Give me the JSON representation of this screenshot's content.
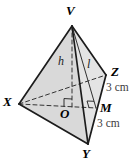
{
  "figure": {
    "canvas": {
      "width": 139,
      "height": 162,
      "background": "#ffffff"
    },
    "colors": {
      "edge": "#1c1c1c",
      "dashed": "#333333",
      "face_left": "#d9d9d9",
      "face_right": "#e4e4e4",
      "measure_text": "#3d3d3d"
    },
    "points": {
      "V": {
        "x": 72,
        "y": 26
      },
      "X": {
        "x": 19,
        "y": 104
      },
      "Y": {
        "x": 88,
        "y": 144
      },
      "Z": {
        "x": 106,
        "y": 75
      },
      "O": {
        "x": 72,
        "y": 107
      },
      "M": {
        "x": 96,
        "y": 108
      }
    },
    "faces": [
      {
        "name": "face-VXY",
        "pts": [
          "V",
          "X",
          "Y"
        ],
        "fill": "#d9d9d9"
      },
      {
        "name": "face-VYZ",
        "pts": [
          "V",
          "Y",
          "Z"
        ],
        "fill": "#e4e4e4"
      }
    ],
    "edges": [
      {
        "name": "hidden-edge-XZ",
        "from": "X",
        "to": "Z",
        "style": "dashed",
        "width": 1
      },
      {
        "name": "median-XM",
        "from": "X",
        "to": "M",
        "style": "dashed",
        "width": 1
      },
      {
        "name": "height-VO",
        "from": "V",
        "to": "O",
        "style": "dashed",
        "width": 1
      },
      {
        "name": "slant-VM",
        "from": "V",
        "to": "M",
        "style": "solid",
        "width": 0.9
      },
      {
        "name": "edge-VX",
        "from": "V",
        "to": "X",
        "style": "solid",
        "width": 1.7
      },
      {
        "name": "edge-VZ",
        "from": "V",
        "to": "Z",
        "style": "solid",
        "width": 1.7
      },
      {
        "name": "edge-VY",
        "from": "V",
        "to": "Y",
        "style": "solid",
        "width": 1.7
      },
      {
        "name": "edge-XY",
        "from": "X",
        "to": "Y",
        "style": "solid",
        "width": 1.7
      },
      {
        "name": "edge-YZ",
        "from": "Y",
        "to": "Z",
        "style": "solid",
        "width": 1.7
      }
    ],
    "right_angles": [
      {
        "name": "right-angle-at-O",
        "at": "O",
        "toward1": "V",
        "toward2": "X",
        "size": 8
      },
      {
        "name": "right-angle-at-M",
        "at": "M",
        "toward1": "V",
        "toward2": "O",
        "size": 7
      }
    ],
    "labels": [
      {
        "id": "V",
        "text": "V",
        "x": 66,
        "y": 4,
        "style": "vertex"
      },
      {
        "id": "X",
        "text": "X",
        "x": 3,
        "y": 95,
        "style": "vertex"
      },
      {
        "id": "Y",
        "text": "Y",
        "x": 82,
        "y": 147,
        "style": "vertex"
      },
      {
        "id": "Z",
        "text": "Z",
        "x": 111,
        "y": 65,
        "style": "vertex"
      },
      {
        "id": "O",
        "text": "O",
        "x": 60,
        "y": 107,
        "style": "vertex"
      },
      {
        "id": "M",
        "text": "M",
        "x": 100,
        "y": 101,
        "style": "vertex"
      },
      {
        "id": "h",
        "text": "h",
        "x": 58,
        "y": 55,
        "style": "measure-italic"
      },
      {
        "id": "l",
        "text": "l",
        "x": 87,
        "y": 58,
        "style": "measure-italic"
      },
      {
        "id": "ZM",
        "text": "3 cm",
        "x": 106,
        "y": 82,
        "style": "measure"
      },
      {
        "id": "MY",
        "text": "3 cm",
        "x": 97,
        "y": 118,
        "style": "measure"
      }
    ]
  }
}
